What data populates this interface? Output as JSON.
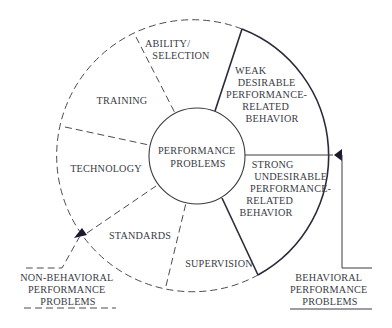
{
  "diagram": {
    "center": {
      "label_lines": [
        "PERFORMANCE",
        "PROBLEMS"
      ]
    },
    "segments": [
      {
        "id": "ability-selection",
        "label_lines": [
          "ABILITY/",
          "SELECTION"
        ],
        "type": "non-behavioral"
      },
      {
        "id": "training",
        "label_lines": [
          "TRAINING"
        ],
        "type": "non-behavioral"
      },
      {
        "id": "technology",
        "label_lines": [
          "TECHNOLOGY"
        ],
        "type": "non-behavioral"
      },
      {
        "id": "standards",
        "label_lines": [
          "STANDARDS"
        ],
        "type": "non-behavioral"
      },
      {
        "id": "supervision",
        "label_lines": [
          "SUPERVISION"
        ],
        "type": "non-behavioral"
      },
      {
        "id": "weak-desirable",
        "label_lines": [
          "WEAK",
          "DESIRABLE",
          "PERFORMANCE-",
          "RELATED",
          "BEHAVIOR"
        ],
        "type": "behavioral"
      },
      {
        "id": "strong-undesirable",
        "label_lines": [
          "STRONG",
          "UNDESIRABLE",
          "PERFORMANCE-",
          "RELATED",
          "BEHAVIOR"
        ],
        "type": "behavioral"
      }
    ],
    "callouts": {
      "non_behavioral": {
        "label_lines": [
          "NON-BEHAVIORAL",
          "PERFORMANCE",
          "PROBLEMS"
        ]
      },
      "behavioral": {
        "label_lines": [
          "BEHAVIORAL",
          "PERFORMANCE",
          "PROBLEMS"
        ]
      }
    },
    "colors": {
      "line": "#2a2a3a",
      "dashed": "#4a4a55",
      "text": "#3a3a44",
      "background": "#ffffff"
    }
  }
}
